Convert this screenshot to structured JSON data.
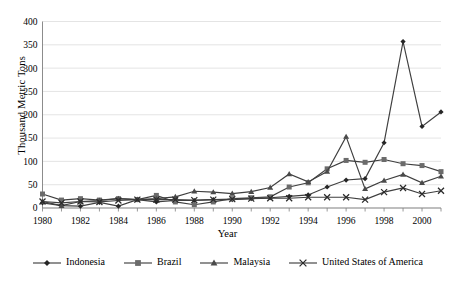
{
  "chart_data": {
    "type": "line",
    "title": "",
    "xlabel": "Year",
    "ylabel": "Thousand Metric Tons",
    "xlim": [
      1980,
      2001
    ],
    "ylim": [
      0,
      400
    ],
    "ytick_step": 50,
    "ytick_labels": [
      "400",
      "350",
      "300",
      "250",
      "200",
      "150",
      "100",
      "50",
      "0"
    ],
    "ytick_values": [
      400,
      350,
      300,
      250,
      200,
      150,
      100,
      50,
      0
    ],
    "xtick_labels": [
      "1980",
      "1982",
      "1984",
      "1986",
      "1988",
      "1990",
      "1992",
      "1994",
      "1996",
      "1998",
      "2000"
    ],
    "xtick_values": [
      1980,
      1982,
      1984,
      1986,
      1988,
      1990,
      1992,
      1994,
      1996,
      1998,
      2000
    ],
    "grid": "horizontal",
    "legend_position": "bottom",
    "x": [
      1980,
      1981,
      1982,
      1983,
      1984,
      1985,
      1986,
      1987,
      1988,
      1989,
      1990,
      1991,
      1992,
      1993,
      1994,
      1995,
      1996,
      1997,
      1998,
      1999,
      2000,
      2001
    ],
    "series": [
      {
        "name": "Indonesia",
        "marker": "diamond",
        "values": [
          11,
          5,
          4,
          12,
          4,
          18,
          13,
          16,
          16,
          18,
          18,
          20,
          22,
          25,
          28,
          45,
          60,
          63,
          140,
          357,
          175,
          206
        ]
      },
      {
        "name": "Brazil",
        "marker": "square",
        "values": [
          30,
          17,
          20,
          17,
          20,
          18,
          27,
          13,
          7,
          13,
          20,
          22,
          24,
          45,
          54,
          84,
          102,
          98,
          104,
          95,
          91,
          78
        ]
      },
      {
        "name": "Malaysia",
        "marker": "triangle",
        "values": [
          14,
          5,
          14,
          16,
          20,
          18,
          20,
          24,
          36,
          34,
          31,
          35,
          44,
          73,
          56,
          78,
          153,
          41,
          59,
          72,
          54,
          68
        ]
      },
      {
        "name": "United States of America",
        "marker": "cross",
        "values": [
          14,
          11,
          14,
          13,
          16,
          18,
          18,
          18,
          17,
          18,
          19,
          20,
          21,
          21,
          23,
          23,
          23,
          18,
          34,
          43,
          30,
          37
        ]
      }
    ]
  },
  "axes": {
    "y_title": "Thousand Metric Tons",
    "x_title": "Year"
  },
  "legend": {
    "items": [
      {
        "label": "Indonesia",
        "marker": "diamond"
      },
      {
        "label": "Brazil",
        "marker": "square"
      },
      {
        "label": "Malaysia",
        "marker": "triangle"
      },
      {
        "label": "United States of America",
        "marker": "cross"
      }
    ]
  },
  "colors": {
    "line": "#3f3f3f",
    "grid": "#d9d9d9",
    "axis": "#7f7f7f",
    "text": "#000000",
    "background": "#ffffff"
  }
}
